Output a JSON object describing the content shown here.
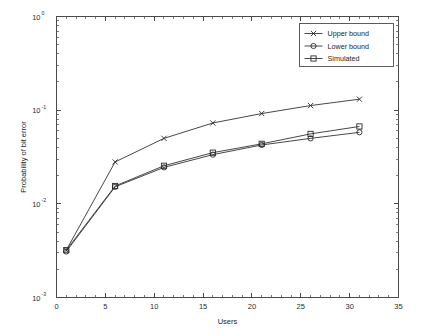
{
  "chart_data": {
    "type": "line",
    "title": "",
    "xlabel": "Users",
    "ylabel": "Probability of bit error",
    "xlim": [
      0,
      35
    ],
    "ylim": [
      0.001,
      1
    ],
    "yscale": "log",
    "xscale": "linear",
    "grid": false,
    "legend_position": "top-right",
    "x": [
      1,
      6,
      11,
      16,
      21,
      26,
      31
    ],
    "xticks": [
      "0",
      "5",
      "10",
      "15",
      "20",
      "25",
      "30",
      "35"
    ],
    "xtick_values": [
      0,
      5,
      10,
      15,
      20,
      25,
      30,
      35
    ],
    "yticks": [
      "10^0",
      "10^-1",
      "10^-2",
      "10^-3"
    ],
    "ytick_values": [
      1,
      0.1,
      0.01,
      0.001
    ],
    "ytick_mantissa": [
      "10",
      "10",
      "10",
      "10"
    ],
    "ytick_exponent": [
      "0",
      "-1",
      "-2",
      "-3"
    ],
    "series": [
      {
        "name": "Upper bound",
        "marker": "x",
        "values": [
          0.0032,
          0.028,
          0.05,
          0.073,
          0.092,
          0.112,
          0.131
        ]
      },
      {
        "name": "Lower bound",
        "marker": "o",
        "values": [
          0.0031,
          0.0152,
          0.0245,
          0.0335,
          0.0425,
          0.05,
          0.058
        ]
      },
      {
        "name": "Simulated",
        "marker": "s",
        "values": [
          0.0032,
          0.0155,
          0.0255,
          0.0352,
          0.0437,
          0.0558,
          0.067
        ]
      }
    ]
  },
  "legend": {
    "entries": [
      {
        "label": "Upper bound",
        "marker": "x"
      },
      {
        "label": "Lower bound",
        "marker": "o"
      },
      {
        "label": "Simulated",
        "marker": "s"
      }
    ]
  },
  "colors": {
    "background": "#ffffff",
    "axis": "#4a4a4a",
    "line": "#333333",
    "text": "#1e1e1e"
  }
}
